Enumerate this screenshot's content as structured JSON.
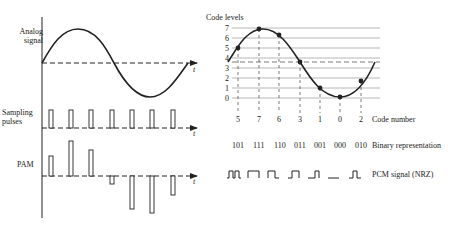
{
  "left_panel": {
    "analog_label_line1": "Analog",
    "analog_label_line2": "signal",
    "sampling_label_line1": "Sampling",
    "sampling_label_line2": "pulses",
    "pam_label": "PAM",
    "time_axis_label": "t"
  },
  "right_panel": {
    "code_levels_title": "Code levels",
    "level_ticks": [
      "7",
      "6",
      "5",
      "4",
      "3",
      "2",
      "1",
      "0"
    ],
    "code_numbers": [
      "5",
      "7",
      "6",
      "3",
      "1",
      "0",
      "2"
    ],
    "code_number_label": "Code number",
    "binary_codes": [
      "101",
      "111",
      "110",
      "011",
      "001",
      "000",
      "010"
    ],
    "binary_label": "Binary representation",
    "pcm_label": "PCM signal (NRZ)"
  },
  "colors": {
    "ink": "#222222",
    "grid": "#9a9a9a",
    "background": "#ffffff"
  }
}
